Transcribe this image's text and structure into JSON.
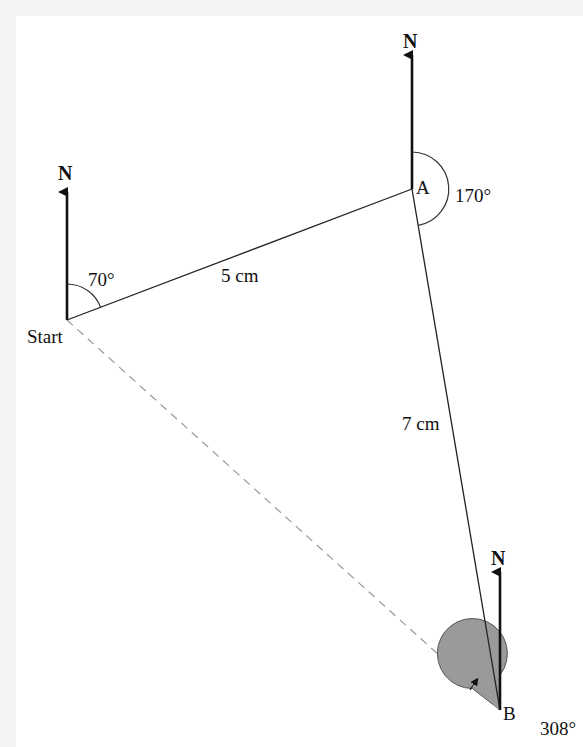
{
  "diagram": {
    "type": "bearings",
    "north_label": "N",
    "points": {
      "start": {
        "label": "Start"
      },
      "a": {
        "label": "A"
      },
      "b": {
        "label": "B"
      }
    },
    "angles": {
      "start": "70°",
      "a": "170°",
      "b": "308°"
    },
    "distances": {
      "start_to_a": "5 cm",
      "a_to_b": "7 cm"
    },
    "colors": {
      "line": "#222222",
      "dashed": "#999999",
      "shaded_angle": "#9a9a9a",
      "background": "#ffffff",
      "margin": "#f4f4f4"
    }
  }
}
